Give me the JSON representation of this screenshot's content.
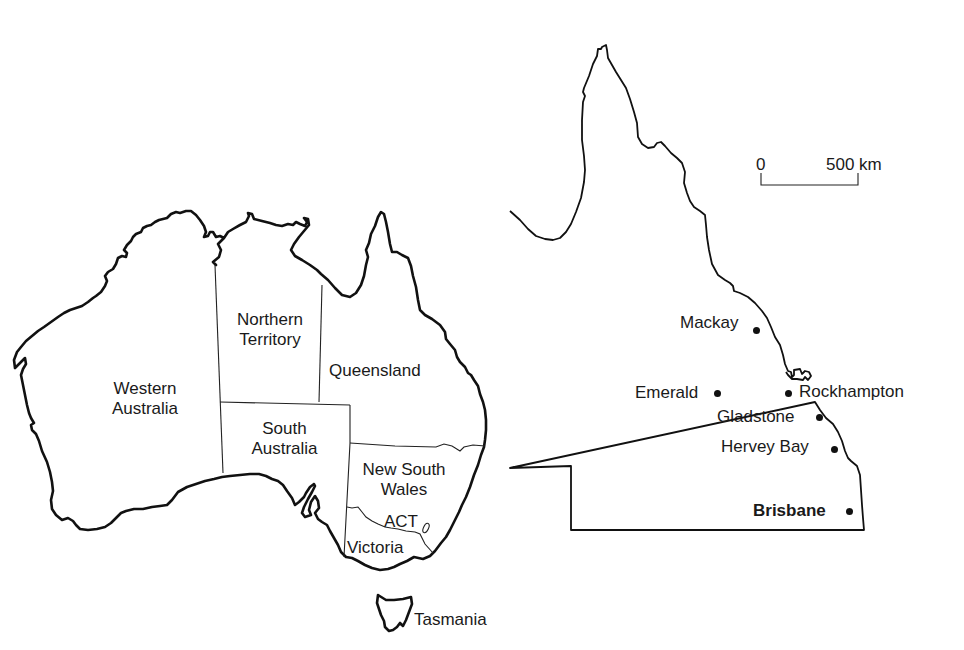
{
  "australia_map": {
    "regions": [
      {
        "id": "western-australia",
        "lines": [
          "Western",
          "Australia"
        ]
      },
      {
        "id": "northern-territory",
        "lines": [
          "Northern",
          "Territory"
        ]
      },
      {
        "id": "queensland",
        "lines": [
          "Queensland"
        ]
      },
      {
        "id": "south-australia",
        "lines": [
          "South",
          "Australia"
        ]
      },
      {
        "id": "new-south-wales",
        "lines": [
          "New South",
          "Wales"
        ]
      },
      {
        "id": "act",
        "lines": [
          "ACT"
        ]
      },
      {
        "id": "victoria",
        "lines": [
          "Victoria"
        ]
      },
      {
        "id": "tasmania",
        "lines": [
          "Tasmania"
        ]
      }
    ]
  },
  "queensland_map": {
    "scale_bar": {
      "start_label": "0",
      "end_label": "500 km"
    },
    "cities": [
      {
        "name": "Mackay",
        "bold": false
      },
      {
        "name": "Emerald",
        "bold": false
      },
      {
        "name": "Rockhampton",
        "bold": false
      },
      {
        "name": "Gladstone",
        "bold": false
      },
      {
        "name": "Hervey Bay",
        "bold": false
      },
      {
        "name": "Brisbane",
        "bold": true
      }
    ]
  },
  "colors": {
    "line": "#111111",
    "background": "#ffffff"
  }
}
